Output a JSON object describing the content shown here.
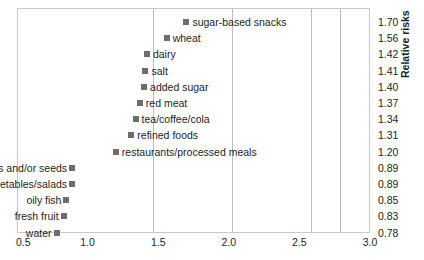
{
  "chart_data": {
    "type": "scatter",
    "title": "",
    "xlabel": "",
    "ylabel": "Relative risks",
    "xlim": [
      0.5,
      3.0
    ],
    "xticks": [
      "0.5",
      "1.0",
      "1.5",
      "2.0",
      "2.5",
      "3.0"
    ],
    "xtick_values": [
      0.5,
      1.0,
      1.5,
      2.0,
      2.5,
      3.0
    ],
    "grid": true,
    "gridlines_x": [
      1.0,
      1.5,
      2.0,
      2.5
    ],
    "legend": "none",
    "categories": [
      "sugar-based snacks",
      "wheat",
      "dairy",
      "salt",
      "added sugar",
      "red meat",
      "tea/coffee/cola",
      "refined foods",
      "restaurants/processed meals",
      "nuts and/or seeds",
      "vegetables/salads",
      "oily fish",
      "fresh fruit",
      "water"
    ],
    "values": [
      1.7,
      1.56,
      1.42,
      1.41,
      1.4,
      1.37,
      1.34,
      1.31,
      1.2,
      0.89,
      0.89,
      0.85,
      0.83,
      0.78
    ],
    "value_labels": [
      "1.70",
      "1.56",
      "1.42",
      "1.41",
      "1.40",
      "1.37",
      "1.34",
      "1.31",
      "1.20",
      "0.89",
      "0.89",
      "0.85",
      "0.83",
      "0.78"
    ]
  },
  "axis": {
    "y_title": "Relative risks",
    "x_ticks": [
      {
        "label": "0.5"
      },
      {
        "label": "1.0"
      },
      {
        "label": "1.5"
      },
      {
        "label": "2.0"
      },
      {
        "label": "2.5"
      },
      {
        "label": "3.0"
      }
    ]
  },
  "rows": [
    {
      "label": "sugar-based snacks",
      "value": "1.70",
      "x": 1.7,
      "side": "right"
    },
    {
      "label": "wheat",
      "value": "1.56",
      "x": 1.56,
      "side": "right"
    },
    {
      "label": "dairy",
      "value": "1.42",
      "x": 1.42,
      "side": "right"
    },
    {
      "label": "salt",
      "value": "1.41",
      "x": 1.41,
      "side": "right"
    },
    {
      "label": "added sugar",
      "value": "1.40",
      "x": 1.4,
      "side": "right"
    },
    {
      "label": "red meat",
      "value": "1.37",
      "x": 1.37,
      "side": "right"
    },
    {
      "label": "tea/coffee/cola",
      "value": "1.34",
      "x": 1.34,
      "side": "right"
    },
    {
      "label": "refined foods",
      "value": "1.31",
      "x": 1.31,
      "side": "right"
    },
    {
      "label": "restaurants/processed meals",
      "value": "1.20",
      "x": 1.2,
      "side": "right"
    },
    {
      "label": "nuts and/or seeds",
      "value": "0.89",
      "x": 0.89,
      "side": "left"
    },
    {
      "label": "vegetables/salads",
      "value": "0.89",
      "x": 0.89,
      "side": "left"
    },
    {
      "label": "oily fish",
      "value": "0.85",
      "x": 0.85,
      "side": "left"
    },
    {
      "label": "fresh fruit",
      "value": "0.83",
      "x": 0.83,
      "side": "left"
    },
    {
      "label": "water",
      "value": "0.78",
      "x": 0.78,
      "side": "left"
    }
  ],
  "style": {
    "marker_color": "#6d6d6d",
    "grid_color": "#bdbdbd",
    "frame_color": "#c9c9c9",
    "text_color": "#231f20"
  }
}
